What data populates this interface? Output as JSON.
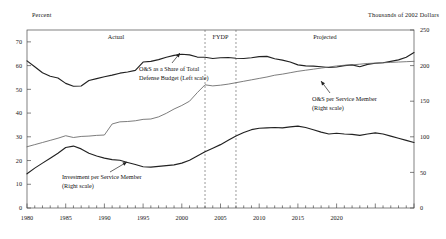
{
  "chart_data": {
    "type": "line",
    "title": "",
    "xlabel": "",
    "ylabel": "Percent",
    "ylabel_right": "Thousands of 2002 Dollars",
    "grid": false,
    "legend_position": "inline-annotations",
    "xlim": [
      1980,
      2030
    ],
    "ylim": [
      0,
      75
    ],
    "ylim_right": [
      0,
      250
    ],
    "x_tick_labels": [
      "1980",
      "1985",
      "1990",
      "1995",
      "2000",
      "2005",
      "2010",
      "2015",
      "2020"
    ],
    "x_ticks": [
      1980,
      1985,
      1990,
      1995,
      2000,
      2005,
      2010,
      2015,
      2020
    ],
    "y_tick_labels_left": [
      "70",
      "60",
      "50",
      "40",
      "30",
      "20",
      "10",
      "0"
    ],
    "y_ticks_left": [
      70,
      60,
      50,
      40,
      30,
      20,
      10,
      0
    ],
    "y_tick_labels_right": [
      "250",
      "200",
      "150",
      "100",
      "50",
      "0"
    ],
    "y_ticks_right": [
      250,
      200,
      150,
      100,
      50,
      0
    ],
    "regions": [
      {
        "label": "Actual",
        "start": 1980,
        "end": 2003
      },
      {
        "label": "FYDP",
        "start": 2003,
        "end": 2007
      },
      {
        "label": "Projected",
        "start": 2007,
        "end": 2030
      }
    ],
    "divider_years": [
      2003,
      2007
    ],
    "x": [
      1980,
      1981,
      1982,
      1983,
      1984,
      1985,
      1986,
      1987,
      1988,
      1989,
      1990,
      1991,
      1992,
      1993,
      1994,
      1995,
      1996,
      1997,
      1998,
      1999,
      2000,
      2001,
      2002,
      2003,
      2004,
      2005,
      2006,
      2007,
      2008,
      2009,
      2010,
      2011,
      2012,
      2013,
      2014,
      2015,
      2016,
      2017,
      2018,
      2019,
      2020,
      2021,
      2022,
      2023,
      2024,
      2025,
      2026,
      2027,
      2028,
      2029,
      2030
    ],
    "series": [
      {
        "name": "O&S as a Share of Total Defense Budget (Left scale)",
        "axis": "left",
        "units": "percent",
        "values": [
          62.0,
          59.5,
          57.0,
          55.5,
          54.8,
          52.5,
          51.3,
          51.4,
          53.7,
          54.5,
          55.3,
          56.0,
          56.8,
          57.3,
          58.0,
          61.5,
          61.8,
          62.5,
          63.5,
          64.3,
          64.8,
          64.5,
          63.6,
          63.5,
          63.0,
          63.3,
          63.4,
          63.1,
          63.0,
          63.3,
          63.8,
          63.9,
          62.9,
          62.3,
          61.5,
          60.3,
          59.9,
          59.8,
          59.5,
          59.2,
          59.4,
          60.0,
          60.3,
          59.5,
          60.5,
          61.0,
          61.2,
          61.8,
          62.4,
          63.5,
          65.5
        ]
      },
      {
        "name": "O&S per Service Member (Right scale)",
        "axis": "right",
        "units": "thousands of 2002 dollars",
        "values": [
          86.0,
          89.0,
          92.0,
          95.0,
          98.0,
          101.5,
          99.0,
          100.5,
          101.0,
          102.0,
          102.5,
          118.0,
          121.0,
          121.5,
          122.5,
          124.5,
          125.0,
          128.0,
          133.0,
          139.0,
          144.0,
          150.0,
          162.0,
          173.0,
          171.5,
          172.5,
          174.0,
          176.0,
          178.0,
          180.0,
          182.0,
          184.0,
          186.5,
          188.0,
          190.0,
          192.0,
          193.5,
          195.0,
          196.5,
          198.0,
          199.5,
          200.5,
          201.0,
          202.0,
          203.0,
          203.5,
          204.0,
          204.5,
          205.0,
          205.5,
          206.0
        ]
      },
      {
        "name": "Investment per Service Member (Right scale)",
        "axis": "right",
        "units": "thousands of 2002 dollars",
        "values": [
          48.0,
          56.0,
          63.0,
          70.0,
          77.0,
          85.0,
          87.0,
          83.0,
          77.0,
          73.0,
          70.0,
          68.0,
          67.0,
          64.0,
          61.0,
          58.0,
          57.5,
          58.5,
          59.5,
          60.5,
          63.0,
          67.0,
          73.0,
          79.0,
          84.0,
          89.0,
          95.0,
          101.0,
          106.0,
          110.0,
          112.0,
          112.5,
          113.0,
          112.5,
          114.0,
          115.0,
          113.0,
          110.0,
          106.5,
          104.0,
          105.0,
          104.0,
          103.5,
          102.0,
          104.0,
          105.5,
          104.0,
          101.0,
          98.0,
          95.0,
          92.0
        ]
      }
    ],
    "annotations": [
      {
        "name": "os-share-annotation",
        "line1": "O&S as a Share of Total",
        "line2": "Defense Budget (Left scale)"
      },
      {
        "name": "os-per-member-annotation",
        "line1": "O&S per Service Member",
        "line2": "(Right scale)"
      },
      {
        "name": "investment-per-member-annotation",
        "line1": "Investment per Service Member",
        "line2": "(Right scale)"
      }
    ],
    "colors": {
      "series_dark": "#222222",
      "series_light": "#666666",
      "frame": "#4a4a4a",
      "divider": "#555555",
      "background": "#ffffff"
    }
  }
}
